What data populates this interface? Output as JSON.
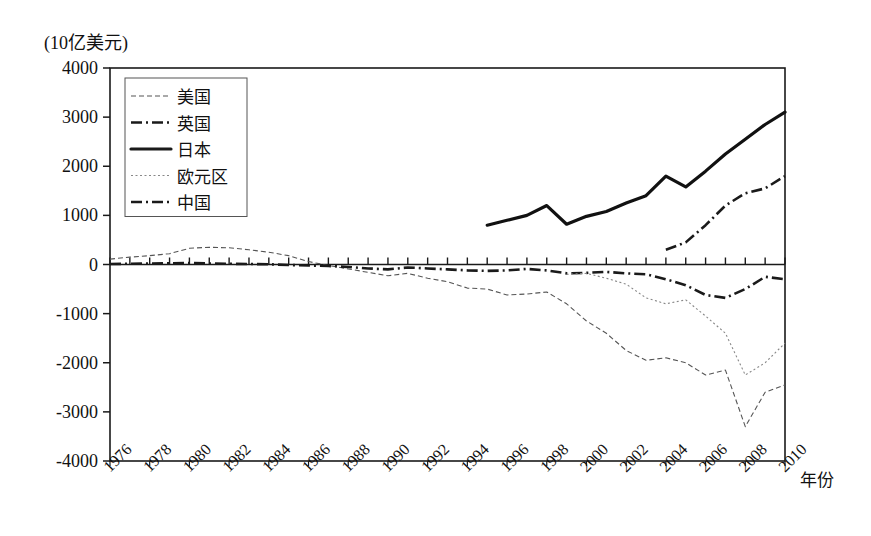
{
  "chart_data": {
    "type": "line",
    "title": "",
    "unit_label": "(10亿美元)",
    "xlabel": "年份",
    "ylabel": "",
    "ylim": [
      -4000,
      4000
    ],
    "xlim": [
      1976,
      2010
    ],
    "grid": false,
    "legend_position": "top-left-inside",
    "y_ticks": [
      "4000",
      "3000",
      "2000",
      "1000",
      "0",
      "-1000",
      "-2000",
      "-3000",
      "-4000"
    ],
    "y_tick_values": [
      4000,
      3000,
      2000,
      1000,
      0,
      -1000,
      -2000,
      -3000,
      -4000
    ],
    "x_ticks": [
      "1976",
      "1978",
      "1980",
      "1982",
      "1984",
      "1986",
      "1988",
      "1990",
      "1992",
      "1994",
      "1996",
      "1998",
      "2000",
      "2002",
      "2004",
      "2006",
      "2008",
      "2010"
    ],
    "x_tick_values": [
      1976,
      1978,
      1980,
      1982,
      1984,
      1986,
      1988,
      1990,
      1992,
      1994,
      1996,
      1998,
      2000,
      2002,
      2004,
      2006,
      2008,
      2010
    ],
    "x_all_years": [
      1976,
      1977,
      1978,
      1979,
      1980,
      1981,
      1982,
      1983,
      1984,
      1985,
      1986,
      1987,
      1988,
      1989,
      1990,
      1991,
      1992,
      1993,
      1994,
      1995,
      1996,
      1997,
      1998,
      1999,
      2000,
      2001,
      2002,
      2003,
      2004,
      2005,
      2006,
      2007,
      2008,
      2009,
      2010
    ],
    "series": [
      {
        "name": "美国",
        "style": "dashed-thin",
        "color": "#555555",
        "x": [
          1976,
          1977,
          1978,
          1979,
          1980,
          1981,
          1982,
          1983,
          1984,
          1985,
          1986,
          1987,
          1988,
          1989,
          1990,
          1991,
          1992,
          1993,
          1994,
          1995,
          1996,
          1997,
          1998,
          1999,
          2000,
          2001,
          2002,
          2003,
          2004,
          2005,
          2006,
          2007,
          2008,
          2009,
          2010
        ],
        "values": [
          110,
          150,
          180,
          220,
          330,
          350,
          340,
          300,
          250,
          180,
          60,
          -20,
          -90,
          -160,
          -230,
          -180,
          -280,
          -350,
          -480,
          -500,
          -620,
          -600,
          -560,
          -800,
          -1150,
          -1400,
          -1750,
          -1950,
          -1900,
          -2000,
          -2250,
          -2150,
          -3300,
          -2600,
          -2450
        ]
      },
      {
        "name": "英国",
        "style": "dashdot-thick",
        "color": "#1a1a1a",
        "x": [
          1976,
          1977,
          1978,
          1979,
          1980,
          1981,
          1982,
          1983,
          1984,
          1985,
          1986,
          1987,
          1988,
          1989,
          1990,
          1991,
          1992,
          1993,
          1994,
          1995,
          1996,
          1997,
          1998,
          1999,
          2000,
          2001,
          2002,
          2003,
          2004,
          2005,
          2006,
          2007,
          2008,
          2009,
          2010
        ],
        "values": [
          10,
          15,
          20,
          25,
          30,
          20,
          15,
          10,
          5,
          -10,
          -20,
          -30,
          -50,
          -80,
          -100,
          -60,
          -80,
          -100,
          -120,
          -130,
          -120,
          -90,
          -120,
          -180,
          -170,
          -150,
          -180,
          -200,
          -300,
          -420,
          -620,
          -680,
          -500,
          -250,
          -300
        ]
      },
      {
        "name": "日本",
        "style": "solid-thick",
        "color": "#111111",
        "x": [
          1995,
          1996,
          1997,
          1998,
          1999,
          2000,
          2001,
          2002,
          2003,
          2004,
          2005,
          2006,
          2007,
          2008,
          2009,
          2010
        ],
        "values": [
          800,
          900,
          1000,
          1200,
          820,
          980,
          1080,
          1250,
          1400,
          1800,
          1580,
          1900,
          2250,
          2550,
          2850,
          3100
        ]
      },
      {
        "name": "欧元区",
        "style": "dotted-thin",
        "color": "#888888",
        "x": [
          1999,
          2000,
          2001,
          2002,
          2003,
          2004,
          2005,
          2006,
          2007,
          2008,
          2009,
          2010
        ],
        "values": [
          -200,
          -180,
          -280,
          -400,
          -680,
          -800,
          -720,
          -1050,
          -1400,
          -2250,
          -2000,
          -1600
        ]
      },
      {
        "name": "中国",
        "style": "dashdot-thick",
        "color": "#1a1a1a",
        "x": [
          2004,
          2005,
          2006,
          2007,
          2008,
          2009,
          2010
        ],
        "values": [
          300,
          450,
          800,
          1200,
          1450,
          1550,
          1800
        ]
      }
    ],
    "legend": [
      {
        "label": "美国",
        "style": "dashed-thin"
      },
      {
        "label": "英国",
        "style": "dashdot-thick"
      },
      {
        "label": "日本",
        "style": "solid-thick"
      },
      {
        "label": "欧元区",
        "style": "dotted-thin"
      },
      {
        "label": "中国",
        "style": "dashdot-thick"
      }
    ]
  }
}
